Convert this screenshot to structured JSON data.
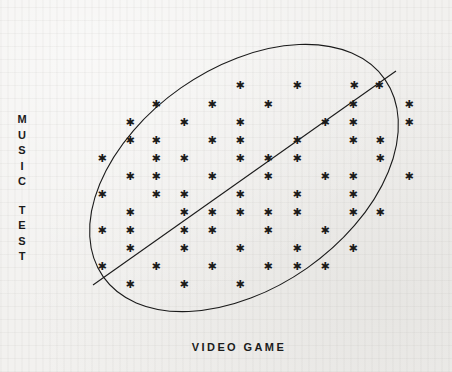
{
  "figure": {
    "background_color": "#f2f1ef",
    "ink_color": "#1b1b1b",
    "y_axis_label": "MUSIC TEST",
    "x_axis_label": "VIDEO GAME",
    "y_axis_letters": [
      "M",
      "U",
      "S",
      "I",
      "C",
      "",
      "T",
      "E",
      "S",
      "T"
    ],
    "marker_glyph": "✱"
  },
  "chart_data": {
    "type": "scatter",
    "title": "",
    "xlabel": "VIDEO GAME",
    "ylabel": "MUSIC TEST",
    "grid": false,
    "legend": "none",
    "axis_ticks": [],
    "xlim": [
      0,
      452
    ],
    "ylim": [
      372,
      0
    ],
    "annotations": {
      "envelope": {
        "shape": "ellipse",
        "center": [
          244,
          178
        ],
        "radius_x": 172,
        "radius_y": 110,
        "rotation_deg": -35,
        "stroke": "#1b1b1b",
        "stroke_width": 1.1,
        "fill": "none"
      },
      "trend_line": {
        "shape": "line",
        "x1": 93,
        "y1": 285,
        "x2": 396,
        "y2": 71,
        "stroke": "#1b1b1b",
        "stroke_width": 1.1
      }
    },
    "points": [
      {
        "x": 240,
        "y": 85
      },
      {
        "x": 297,
        "y": 85
      },
      {
        "x": 354,
        "y": 85
      },
      {
        "x": 379,
        "y": 85
      },
      {
        "x": 156,
        "y": 104
      },
      {
        "x": 212,
        "y": 104
      },
      {
        "x": 268,
        "y": 104
      },
      {
        "x": 353,
        "y": 104
      },
      {
        "x": 409,
        "y": 104
      },
      {
        "x": 130,
        "y": 122
      },
      {
        "x": 184,
        "y": 122
      },
      {
        "x": 240,
        "y": 122
      },
      {
        "x": 325,
        "y": 122
      },
      {
        "x": 353,
        "y": 122
      },
      {
        "x": 409,
        "y": 122
      },
      {
        "x": 130,
        "y": 140
      },
      {
        "x": 156,
        "y": 140
      },
      {
        "x": 212,
        "y": 140
      },
      {
        "x": 240,
        "y": 140
      },
      {
        "x": 297,
        "y": 140
      },
      {
        "x": 353,
        "y": 140
      },
      {
        "x": 380,
        "y": 140
      },
      {
        "x": 102,
        "y": 158
      },
      {
        "x": 156,
        "y": 158
      },
      {
        "x": 184,
        "y": 158
      },
      {
        "x": 240,
        "y": 158
      },
      {
        "x": 268,
        "y": 158
      },
      {
        "x": 297,
        "y": 158
      },
      {
        "x": 380,
        "y": 158
      },
      {
        "x": 130,
        "y": 176
      },
      {
        "x": 156,
        "y": 176
      },
      {
        "x": 212,
        "y": 176
      },
      {
        "x": 268,
        "y": 176
      },
      {
        "x": 325,
        "y": 176
      },
      {
        "x": 353,
        "y": 176
      },
      {
        "x": 409,
        "y": 176
      },
      {
        "x": 102,
        "y": 194
      },
      {
        "x": 156,
        "y": 194
      },
      {
        "x": 184,
        "y": 194
      },
      {
        "x": 240,
        "y": 194
      },
      {
        "x": 297,
        "y": 194
      },
      {
        "x": 353,
        "y": 194
      },
      {
        "x": 130,
        "y": 212
      },
      {
        "x": 184,
        "y": 212
      },
      {
        "x": 212,
        "y": 212
      },
      {
        "x": 240,
        "y": 212
      },
      {
        "x": 268,
        "y": 212
      },
      {
        "x": 297,
        "y": 212
      },
      {
        "x": 353,
        "y": 212
      },
      {
        "x": 380,
        "y": 212
      },
      {
        "x": 102,
        "y": 230
      },
      {
        "x": 130,
        "y": 230
      },
      {
        "x": 184,
        "y": 230
      },
      {
        "x": 212,
        "y": 230
      },
      {
        "x": 268,
        "y": 230
      },
      {
        "x": 325,
        "y": 230
      },
      {
        "x": 130,
        "y": 248
      },
      {
        "x": 184,
        "y": 248
      },
      {
        "x": 240,
        "y": 248
      },
      {
        "x": 297,
        "y": 248
      },
      {
        "x": 353,
        "y": 248
      },
      {
        "x": 102,
        "y": 266
      },
      {
        "x": 156,
        "y": 266
      },
      {
        "x": 212,
        "y": 266
      },
      {
        "x": 268,
        "y": 266
      },
      {
        "x": 297,
        "y": 266
      },
      {
        "x": 325,
        "y": 266
      },
      {
        "x": 130,
        "y": 284
      },
      {
        "x": 184,
        "y": 284
      },
      {
        "x": 240,
        "y": 284
      }
    ]
  }
}
